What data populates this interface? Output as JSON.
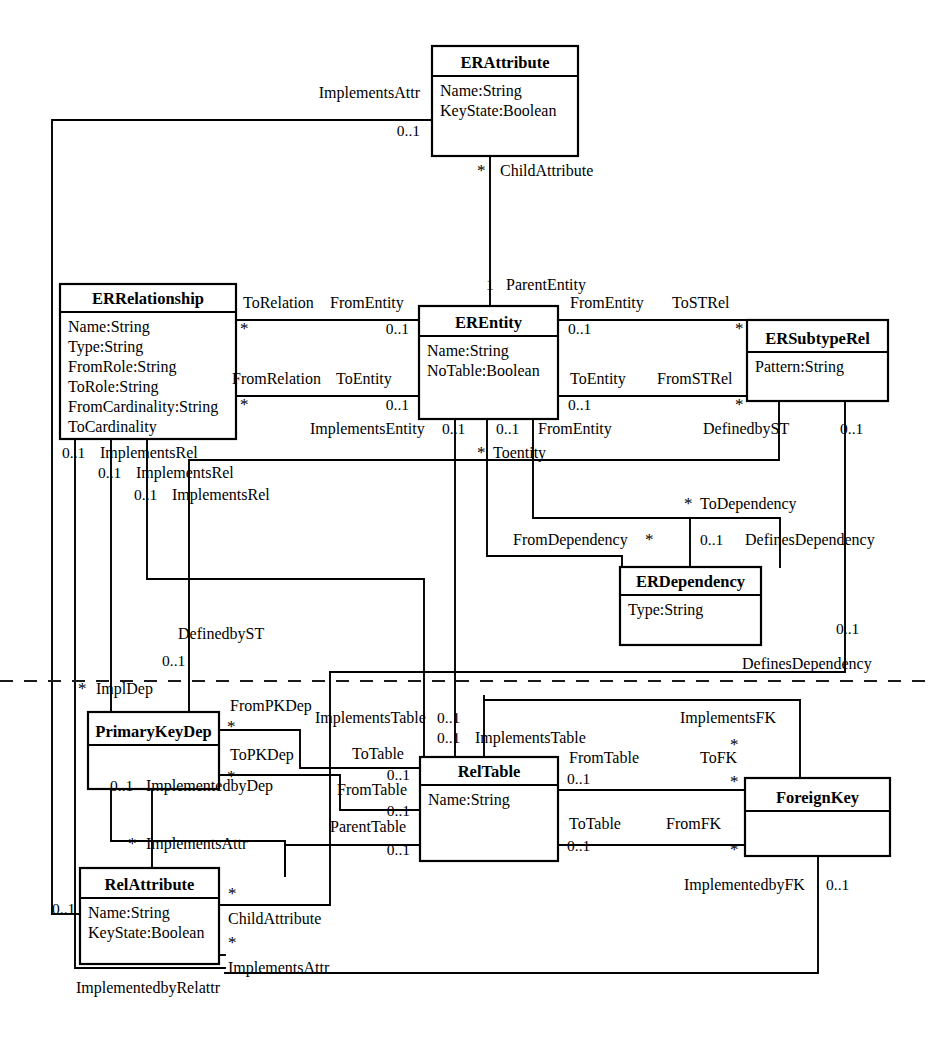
{
  "diagram": {
    "kind": "uml-class-diagram",
    "width": 931,
    "height": 1040,
    "background_color": "#ffffff",
    "line_color": "#000000",
    "package_separator": {
      "style": "dashed",
      "y": 681,
      "x_start": 0,
      "x_end": 931
    }
  },
  "classes": [
    {
      "id": "erattribute",
      "name": "ERAttribute",
      "attributes": [
        "Name:String",
        "KeyState:Boolean"
      ],
      "x": 432,
      "y": 46,
      "w": 146,
      "h": 110,
      "header_h": 30
    },
    {
      "id": "errelationship",
      "name": "ERRelationship",
      "attributes": [
        "Name:String",
        "Type:String",
        "FromRole:String",
        "ToRole:String",
        "FromCardinality:String",
        "ToCardinality"
      ],
      "x": 60,
      "y": 284,
      "w": 176,
      "h": 155,
      "header_h": 28
    },
    {
      "id": "erentity",
      "name": "EREntity",
      "attributes": [
        "Name:String",
        "NoTable:Boolean"
      ],
      "x": 419,
      "y": 306,
      "w": 139,
      "h": 113,
      "header_h": 30
    },
    {
      "id": "ersubtyperel",
      "name": "ERSubtypeRel",
      "attributes": [
        "Pattern:String"
      ],
      "x": 747,
      "y": 320,
      "w": 141,
      "h": 81,
      "header_h": 32
    },
    {
      "id": "erdependency",
      "name": "ERDependency",
      "attributes": [
        "Type:String"
      ],
      "x": 620,
      "y": 567,
      "w": 141,
      "h": 78,
      "header_h": 28
    },
    {
      "id": "primarykeydep",
      "name": "PrimaryKeyDep",
      "attributes": [],
      "x": 88,
      "y": 712,
      "w": 131,
      "h": 77,
      "header_h": 33
    },
    {
      "id": "reltable",
      "name": "RelTable",
      "attributes": [
        "Name:String"
      ],
      "x": 420,
      "y": 757,
      "w": 138,
      "h": 104,
      "header_h": 28
    },
    {
      "id": "foreignkey",
      "name": "ForeignKey",
      "attributes": [],
      "x": 745,
      "y": 778,
      "w": 145,
      "h": 78,
      "header_h": 33
    },
    {
      "id": "relattribute",
      "name": "RelAttribute",
      "attributes": [
        "Name:String",
        "KeyState:Boolean"
      ],
      "x": 80,
      "y": 868,
      "w": 139,
      "h": 96,
      "header_h": 30
    }
  ],
  "role_labels": [
    {
      "id": "implementsattr-top",
      "text": "ImplementsAttr",
      "x": 420,
      "y": 98,
      "anchor": "end"
    },
    {
      "id": "childattribute-top",
      "text": "ChildAttribute",
      "x": 500,
      "y": 176,
      "anchor": "start"
    },
    {
      "id": "parententity",
      "text": "ParentEntity",
      "x": 506,
      "y": 290,
      "anchor": "start"
    },
    {
      "id": "torelation",
      "text": "ToRelation",
      "x": 243,
      "y": 308,
      "anchor": "start"
    },
    {
      "id": "fromentity-left",
      "text": "FromEntity",
      "x": 330,
      "y": 308,
      "anchor": "start"
    },
    {
      "id": "fromentity-right",
      "text": "FromEntity",
      "x": 570,
      "y": 308,
      "anchor": "start"
    },
    {
      "id": "tostrel",
      "text": "ToSTRel",
      "x": 672,
      "y": 308,
      "anchor": "start"
    },
    {
      "id": "fromrelation",
      "text": "FromRelation",
      "x": 232,
      "y": 384,
      "anchor": "start"
    },
    {
      "id": "toentity-left",
      "text": "ToEntity",
      "x": 336,
      "y": 384,
      "anchor": "start"
    },
    {
      "id": "toentity-right",
      "text": "ToEntity",
      "x": 570,
      "y": 384,
      "anchor": "start"
    },
    {
      "id": "fromstrel",
      "text": "FromSTRel",
      "x": 657,
      "y": 384,
      "anchor": "start"
    },
    {
      "id": "implementsentity",
      "text": "ImplementsEntity",
      "x": 310,
      "y": 434,
      "anchor": "start"
    },
    {
      "id": "fromentity-mid",
      "text": "FromEntity",
      "x": 538,
      "y": 434,
      "anchor": "start"
    },
    {
      "id": "definedbyst-right",
      "text": "DefinedbyST",
      "x": 703,
      "y": 434,
      "anchor": "start"
    },
    {
      "id": "implementsrel-1",
      "text": "ImplementsRel",
      "x": 100,
      "y": 458,
      "anchor": "start"
    },
    {
      "id": "toentity-lower",
      "text": "Toentity",
      "x": 493,
      "y": 458,
      "anchor": "start"
    },
    {
      "id": "implementsrel-2",
      "text": "ImplementsRel",
      "x": 136,
      "y": 478,
      "anchor": "start"
    },
    {
      "id": "implementsrel-3",
      "text": "ImplementsRel",
      "x": 172,
      "y": 500,
      "anchor": "start"
    },
    {
      "id": "todependency",
      "text": "ToDependency",
      "x": 700,
      "y": 509,
      "anchor": "start"
    },
    {
      "id": "fromdependency",
      "text": "FromDependency",
      "x": 513,
      "y": 545,
      "anchor": "start"
    },
    {
      "id": "definesdependency-mid",
      "text": "DefinesDependency",
      "x": 745,
      "y": 545,
      "anchor": "start"
    },
    {
      "id": "definedbyst-left",
      "text": "DefinedbyST",
      "x": 178,
      "y": 639,
      "anchor": "start"
    },
    {
      "id": "definesdependency-bot",
      "text": "DefinesDependency",
      "x": 742,
      "y": 669,
      "anchor": "start"
    },
    {
      "id": "impldep",
      "text": "ImplDep",
      "x": 96,
      "y": 694,
      "anchor": "start"
    },
    {
      "id": "frompkdep",
      "text": "FromPKDep",
      "x": 230,
      "y": 711,
      "anchor": "start"
    },
    {
      "id": "implementstable-1",
      "text": "ImplementsTable",
      "x": 315,
      "y": 723,
      "anchor": "start"
    },
    {
      "id": "implementsfk",
      "text": "ImplementsFK",
      "x": 680,
      "y": 723,
      "anchor": "start"
    },
    {
      "id": "implementstable-2",
      "text": "ImplementsTable",
      "x": 475,
      "y": 743,
      "anchor": "start"
    },
    {
      "id": "topkdep",
      "text": "ToPKDep",
      "x": 230,
      "y": 760,
      "anchor": "start"
    },
    {
      "id": "totable-upper",
      "text": "ToTable",
      "x": 352,
      "y": 759,
      "anchor": "start"
    },
    {
      "id": "fromtable-right",
      "text": "FromTable",
      "x": 569,
      "y": 763,
      "anchor": "start"
    },
    {
      "id": "tofk",
      "text": "ToFK",
      "x": 700,
      "y": 763,
      "anchor": "start"
    },
    {
      "id": "fromtable-left",
      "text": "FromTable",
      "x": 337,
      "y": 795,
      "anchor": "start"
    },
    {
      "id": "implementedbydep",
      "text": "ImplementedbyDep",
      "x": 146,
      "y": 791,
      "anchor": "start"
    },
    {
      "id": "parenttable",
      "text": "ParentTable",
      "x": 330,
      "y": 832,
      "anchor": "start"
    },
    {
      "id": "totable-lower",
      "text": "ToTable",
      "x": 569,
      "y": 829,
      "anchor": "start"
    },
    {
      "id": "fromfk",
      "text": "FromFK",
      "x": 666,
      "y": 829,
      "anchor": "start"
    },
    {
      "id": "implementsattr-mid",
      "text": "ImplementsAttr",
      "x": 146,
      "y": 849,
      "anchor": "start"
    },
    {
      "id": "childattribute-bot",
      "text": "ChildAttribute",
      "x": 228,
      "y": 924,
      "anchor": "start"
    },
    {
      "id": "implementedbyfk",
      "text": "ImplementedbyFK",
      "x": 684,
      "y": 890,
      "anchor": "start"
    },
    {
      "id": "implementsattr-bot",
      "text": "ImplementsAttr",
      "x": 228,
      "y": 973,
      "anchor": "start"
    },
    {
      "id": "implementedbyrelattr",
      "text": "ImplementedbyRelattr",
      "x": 76,
      "y": 993,
      "anchor": "start"
    }
  ],
  "multiplicity_labels": [
    {
      "id": "m-implementsattr-top",
      "text": "0..1",
      "x": 420,
      "y": 136,
      "anchor": "end"
    },
    {
      "id": "m-childattr-top-star",
      "text": "*",
      "x": 477,
      "y": 176,
      "anchor": "start"
    },
    {
      "id": "m-parententity",
      "text": "1",
      "x": 486,
      "y": 290,
      "anchor": "start"
    },
    {
      "id": "m-torelation-star",
      "text": "*",
      "x": 240,
      "y": 334,
      "anchor": "start"
    },
    {
      "id": "m-fromentity-left",
      "text": "0..1",
      "x": 409,
      "y": 334,
      "anchor": "end"
    },
    {
      "id": "m-fromentity-right",
      "text": "0..1",
      "x": 568,
      "y": 334,
      "anchor": "start"
    },
    {
      "id": "m-tostrel-star",
      "text": "*",
      "x": 735,
      "y": 334,
      "anchor": "start"
    },
    {
      "id": "m-fromrelation-star",
      "text": "*",
      "x": 240,
      "y": 410,
      "anchor": "start"
    },
    {
      "id": "m-toentity-left",
      "text": "0..1",
      "x": 409,
      "y": 410,
      "anchor": "end"
    },
    {
      "id": "m-toentity-right",
      "text": "0..1",
      "x": 568,
      "y": 410,
      "anchor": "start"
    },
    {
      "id": "m-fromstrel-star",
      "text": "*",
      "x": 735,
      "y": 410,
      "anchor": "start"
    },
    {
      "id": "m-implementsentity",
      "text": "0..1",
      "x": 442,
      "y": 434,
      "anchor": "start"
    },
    {
      "id": "m-fromentity-mid",
      "text": "0..1",
      "x": 496,
      "y": 434,
      "anchor": "start"
    },
    {
      "id": "m-definedbyst-right",
      "text": "0..1",
      "x": 840,
      "y": 434,
      "anchor": "start"
    },
    {
      "id": "m-implementsrel-1",
      "text": "0..1",
      "x": 62,
      "y": 458,
      "anchor": "start"
    },
    {
      "id": "m-toentity-lower",
      "text": "*",
      "x": 477,
      "y": 458,
      "anchor": "start"
    },
    {
      "id": "m-implementsrel-2",
      "text": "0..1",
      "x": 98,
      "y": 478,
      "anchor": "start"
    },
    {
      "id": "m-implementsrel-3",
      "text": "0..1",
      "x": 134,
      "y": 500,
      "anchor": "start"
    },
    {
      "id": "m-todependency-star",
      "text": "*",
      "x": 684,
      "y": 509,
      "anchor": "start"
    },
    {
      "id": "m-fromdependency-star",
      "text": "*",
      "x": 645,
      "y": 545,
      "anchor": "start"
    },
    {
      "id": "m-definesdep-mid",
      "text": "0..1",
      "x": 700,
      "y": 545,
      "anchor": "start"
    },
    {
      "id": "m-definesdep-right",
      "text": "0..1",
      "x": 836,
      "y": 634,
      "anchor": "start"
    },
    {
      "id": "m-definedbyst-left",
      "text": "0..1",
      "x": 162,
      "y": 666,
      "anchor": "start"
    },
    {
      "id": "m-impldep-star",
      "text": "*",
      "x": 78,
      "y": 694,
      "anchor": "start"
    },
    {
      "id": "m-frompkdep-star",
      "text": "*",
      "x": 227,
      "y": 732,
      "anchor": "start"
    },
    {
      "id": "m-implementstable-1",
      "text": "0..1",
      "x": 437,
      "y": 723,
      "anchor": "start"
    },
    {
      "id": "m-implementsfk-star",
      "text": "*",
      "x": 730,
      "y": 750,
      "anchor": "start"
    },
    {
      "id": "m-implementstable-2",
      "text": "0..1",
      "x": 437,
      "y": 743,
      "anchor": "start"
    },
    {
      "id": "m-topkdep-star",
      "text": "*",
      "x": 227,
      "y": 782,
      "anchor": "start"
    },
    {
      "id": "m-totable-upper",
      "text": "0..1",
      "x": 410,
      "y": 780,
      "anchor": "end"
    },
    {
      "id": "m-fromtable-right",
      "text": "0..1",
      "x": 567,
      "y": 784,
      "anchor": "start"
    },
    {
      "id": "m-tofk-star",
      "text": "*",
      "x": 730,
      "y": 787,
      "anchor": "start"
    },
    {
      "id": "m-fromtable-left",
      "text": "0..1",
      "x": 410,
      "y": 816,
      "anchor": "end"
    },
    {
      "id": "m-implementedbydep",
      "text": "0..1",
      "x": 110,
      "y": 791,
      "anchor": "start"
    },
    {
      "id": "m-implementsattr-mid",
      "text": "*",
      "x": 128,
      "y": 849,
      "anchor": "start"
    },
    {
      "id": "m-parenttable",
      "text": "0..1",
      "x": 410,
      "y": 855,
      "anchor": "end"
    },
    {
      "id": "m-totable-lower",
      "text": "0..1",
      "x": 567,
      "y": 851,
      "anchor": "start"
    },
    {
      "id": "m-fromfk-star",
      "text": "*",
      "x": 730,
      "y": 855,
      "anchor": "start"
    },
    {
      "id": "m-childattr-bot-star",
      "text": "*",
      "x": 228,
      "y": 899,
      "anchor": "start"
    },
    {
      "id": "m-implementedbyfk",
      "text": "0..1",
      "x": 826,
      "y": 890,
      "anchor": "start"
    },
    {
      "id": "m-relattr-left",
      "text": "0..1",
      "x": 52,
      "y": 914,
      "anchor": "start"
    },
    {
      "id": "m-implementsattr-bot",
      "text": "*",
      "x": 228,
      "y": 948,
      "anchor": "start"
    }
  ],
  "connectors": [
    {
      "id": "c-implementsattr-top",
      "points": "432,120 52,120 52,914"
    },
    {
      "id": "c-childattribute-top",
      "points": "490,156 490,306"
    },
    {
      "id": "c-torelation-fromentity",
      "points": "236,320 419,320"
    },
    {
      "id": "c-fromrelation-toentity",
      "points": "236,396 419,396"
    },
    {
      "id": "c-fromentity-tostrel",
      "points": "558,320 747,320"
    },
    {
      "id": "c-toentity-fromstrel",
      "points": "558,396 747,396"
    },
    {
      "id": "c-implementsrel-1",
      "points": "75,439 75,968 225,968"
    },
    {
      "id": "c-implementsrel-2",
      "points": "111,439 111,841 285,841 285,876"
    },
    {
      "id": "c-implementsrel-3",
      "points": "147,439 147,579 424,579 424,757"
    },
    {
      "id": "c-implementsentity",
      "points": "455,419 455,752"
    },
    {
      "id": "c-toentity-dependency",
      "points": "487,419 487,556 622,556 622,567"
    },
    {
      "id": "c-fromentity-dependency",
      "points": "533,419 533,518 690,518 690,567"
    },
    {
      "id": "c-todependency-defines",
      "points": "690,518 780,518 780,567"
    },
    {
      "id": "c-definedbyst-left",
      "points": "779,401 779,460 189,460 189,660 189,736"
    },
    {
      "id": "c-definesdependency",
      "points": "845,401 845,672 330,672"
    },
    {
      "id": "c-frompkdep-table",
      "points": "219,730 300,730 300,768 420,768"
    },
    {
      "id": "c-topkdep-table",
      "points": "219,775 340,775 340,810 420,810"
    },
    {
      "id": "c-implementstable-1",
      "points": "455,752 455,757"
    },
    {
      "id": "c-implementstable-2",
      "points": "484,696 484,757"
    },
    {
      "id": "c-implementedbydep",
      "points": "152,789 152,868"
    },
    {
      "id": "c-parenttable",
      "points": "420,845 285,845 285,876"
    },
    {
      "id": "c-fromtable-tofk",
      "points": "558,790 745,790"
    },
    {
      "id": "c-totable-fromfk",
      "points": "558,845 745,845"
    },
    {
      "id": "c-implementsfk",
      "points": "800,778 800,700 484,700"
    },
    {
      "id": "c-implementedbyfk",
      "points": "818,856 818,973 225,973"
    },
    {
      "id": "c-childattribute-bot",
      "points": "219,905 330,905 330,672"
    },
    {
      "id": "c-implementsattr-bot",
      "points": "219,955 225,955"
    },
    {
      "id": "c-relattr-left",
      "points": "52,914 80,914"
    }
  ]
}
